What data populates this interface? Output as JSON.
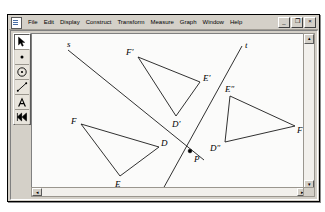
{
  "app": {
    "title_icon": "document-icon",
    "menus": [
      "File",
      "Edit",
      "Display",
      "Construct",
      "Transform",
      "Measure",
      "Graph",
      "Window",
      "Help"
    ],
    "window_buttons": [
      {
        "name": "minimize",
        "glyph": "_"
      },
      {
        "name": "restore",
        "glyph": "❐"
      },
      {
        "name": "close",
        "glyph": "×"
      }
    ]
  },
  "toolbar": {
    "tools": [
      {
        "name": "selection-arrow-tool",
        "selected": true
      },
      {
        "name": "point-tool",
        "selected": false
      },
      {
        "name": "compass-circle-tool",
        "selected": false
      },
      {
        "name": "straightedge-segment-tool",
        "selected": false
      },
      {
        "name": "text-label-tool",
        "selected": false
      },
      {
        "name": "custom-transform-tool",
        "selected": false
      }
    ]
  },
  "scrollbars": {
    "v_up": "▴",
    "v_down": "▾",
    "h_left": "◂",
    "h_right": "▸"
  },
  "sketch": {
    "lines": [
      {
        "name": "line-s",
        "label": "s",
        "x1": 36,
        "y1": 16,
        "x2": 172,
        "y2": 126,
        "label_x": 35,
        "label_y": 13
      },
      {
        "name": "line-t",
        "label": "t",
        "x1": 210,
        "y1": 12,
        "x2": 131,
        "y2": 155,
        "label_x": 213,
        "label_y": 14
      }
    ],
    "points": [
      {
        "name": "point-P",
        "label": "P",
        "x": 158,
        "y": 117,
        "label_x": 162,
        "label_y": 128,
        "marked": true
      }
    ],
    "triangles": [
      {
        "name": "triangle-DEF",
        "vertices": [
          {
            "label": "F",
            "x": 49,
            "y": 90,
            "label_x": 39,
            "label_y": 90
          },
          {
            "label": "D",
            "x": 127,
            "y": 113,
            "label_x": 129,
            "label_y": 112
          },
          {
            "label": "E",
            "x": 88,
            "y": 142,
            "label_x": 83,
            "label_y": 153
          }
        ]
      },
      {
        "name": "triangle-DEF-prime",
        "vertices": [
          {
            "label": "F'",
            "x": 106,
            "y": 23,
            "label_x": 94,
            "label_y": 21
          },
          {
            "label": "E'",
            "x": 168,
            "y": 48,
            "label_x": 171,
            "label_y": 47
          },
          {
            "label": "D'",
            "x": 144,
            "y": 82,
            "label_x": 140,
            "label_y": 93
          }
        ]
      },
      {
        "name": "triangle-DEF-double-prime",
        "vertices": [
          {
            "label": "E″",
            "x": 198,
            "y": 62,
            "label_x": 193,
            "label_y": 58
          },
          {
            "label": "F″",
            "x": 263,
            "y": 92,
            "label_x": 265,
            "label_y": 99
          },
          {
            "label": "D″",
            "x": 193,
            "y": 108,
            "label_x": 178,
            "label_y": 117
          }
        ]
      }
    ]
  }
}
